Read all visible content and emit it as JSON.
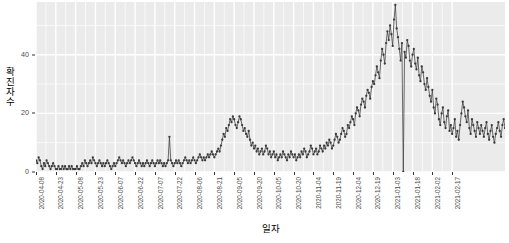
{
  "chart_data": {
    "type": "line",
    "title": "",
    "subtitle": "",
    "xlabel": "일자",
    "ylabel": "확진자수",
    "grid": true,
    "legend": false,
    "legend_position": "none",
    "marker": "point",
    "series_color": "#3a3a3a",
    "panel_background": "#EBEBEB",
    "gridline_color": "#FFFFFF",
    "xlim": [
      "2020-04-08",
      "2021-02-17"
    ],
    "ylim": [
      0,
      58
    ],
    "y_ticks": [
      0,
      20,
      40
    ],
    "y_tick_labels": [
      "0",
      "20",
      "40"
    ],
    "x_ticks": [
      "2020-04-08",
      "2020-04-23",
      "2020-05-08",
      "2020-05-23",
      "2020-06-07",
      "2020-06-22",
      "2020-07-07",
      "2020-07-22",
      "2020-08-06",
      "2020-08-21",
      "2020-09-05",
      "2020-09-20",
      "2020-10-05",
      "2020-10-20",
      "2020-11-04",
      "2020-11-19",
      "2020-12-04",
      "2020-12-19",
      "2021-01-03",
      "2021-01-18",
      "2021-02-02",
      "2021-02-17"
    ],
    "x_tick_interval_days": 15,
    "annotations": [
      "2020-12-19 drops sharply to 0 (reporting gap)"
    ],
    "series": [
      {
        "name": "확진자수",
        "x_start": "2020-04-08",
        "x_step_days": 1,
        "values": [
          4,
          3,
          5,
          4,
          2,
          1,
          3,
          2,
          4,
          3,
          2,
          1,
          2,
          3,
          2,
          1,
          1,
          2,
          1,
          1,
          2,
          1,
          2,
          1,
          1,
          2,
          1,
          2,
          1,
          1,
          1,
          2,
          1,
          1,
          2,
          3,
          2,
          4,
          3,
          2,
          3,
          4,
          3,
          5,
          4,
          3,
          2,
          3,
          4,
          3,
          2,
          3,
          2,
          3,
          4,
          3,
          2,
          1,
          2,
          3,
          2,
          3,
          4,
          5,
          4,
          3,
          4,
          3,
          2,
          3,
          4,
          3,
          4,
          5,
          4,
          3,
          2,
          3,
          4,
          3,
          2,
          3,
          2,
          3,
          4,
          3,
          2,
          3,
          4,
          3,
          2,
          3,
          4,
          3,
          4,
          3,
          2,
          3,
          2,
          3,
          4,
          12,
          4,
          3,
          2,
          3,
          4,
          3,
          4,
          3,
          2,
          3,
          4,
          5,
          4,
          3,
          4,
          3,
          4,
          5,
          4,
          3,
          4,
          5,
          6,
          5,
          4,
          5,
          4,
          5,
          6,
          5,
          6,
          7,
          6,
          5,
          6,
          7,
          8,
          7,
          9,
          11,
          13,
          12,
          15,
          14,
          16,
          18,
          17,
          19,
          18,
          16,
          15,
          17,
          19,
          18,
          16,
          14,
          15,
          13,
          12,
          14,
          11,
          9,
          10,
          8,
          9,
          7,
          8,
          6,
          7,
          8,
          6,
          7,
          9,
          8,
          6,
          7,
          5,
          6,
          7,
          5,
          6,
          4,
          5,
          6,
          5,
          7,
          6,
          5,
          4,
          6,
          5,
          7,
          6,
          5,
          6,
          4,
          5,
          6,
          5,
          7,
          6,
          8,
          7,
          5,
          6,
          7,
          9,
          8,
          6,
          7,
          8,
          6,
          7,
          9,
          8,
          7,
          9,
          8,
          10,
          9,
          11,
          10,
          8,
          9,
          11,
          13,
          12,
          10,
          11,
          13,
          15,
          14,
          12,
          13,
          16,
          15,
          17,
          19,
          18,
          16,
          20,
          22,
          21,
          19,
          23,
          25,
          24,
          22,
          26,
          28,
          27,
          25,
          29,
          31,
          30,
          33,
          36,
          34,
          32,
          38,
          42,
          40,
          37,
          44,
          48,
          45,
          50,
          47,
          43,
          52,
          57,
          49,
          46,
          42,
          38,
          44,
          0,
          41,
          39,
          45,
          43,
          38,
          36,
          40,
          42,
          37,
          35,
          39,
          33,
          31,
          36,
          34,
          30,
          28,
          32,
          29,
          26,
          24,
          28,
          22,
          20,
          25,
          23,
          18,
          16,
          20,
          22,
          17,
          15,
          19,
          21,
          14,
          16,
          13,
          15,
          18,
          12,
          14,
          11,
          16,
          20,
          24,
          22,
          19,
          17,
          21,
          15,
          13,
          18,
          16,
          14,
          12,
          17,
          15,
          13,
          16,
          14,
          12,
          15,
          17,
          13,
          11,
          14,
          16,
          12,
          10,
          13,
          15,
          17,
          14,
          12,
          16,
          18,
          15
        ]
      }
    ]
  }
}
